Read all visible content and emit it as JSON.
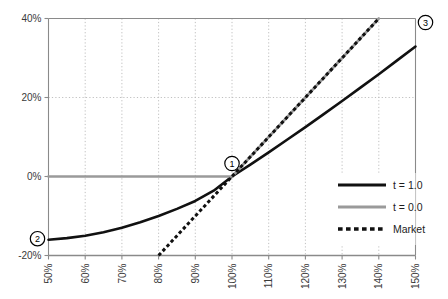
{
  "chart_data": {
    "type": "line",
    "title": "",
    "subtitle": "",
    "xlabel": "",
    "ylabel": "",
    "xlim": [
      50,
      150
    ],
    "ylim": [
      -20,
      40
    ],
    "grid": true,
    "grid_style": "dotted",
    "legend_position": "bottom-right",
    "x_tick_labels": [
      "50%",
      "60%",
      "70%",
      "80%",
      "90%",
      "100%",
      "110%",
      "120%",
      "130%",
      "140%",
      "150%"
    ],
    "x_tick_values": [
      50,
      60,
      70,
      80,
      90,
      100,
      110,
      120,
      130,
      140,
      150
    ],
    "x_tick_rotation": -90,
    "y_tick_labels": [
      "-20%",
      "0%",
      "20%",
      "40%"
    ],
    "y_tick_values": [
      -20,
      0,
      20,
      40
    ],
    "series": [
      {
        "name": "t = 1.0",
        "style": "solid",
        "color": "#111111",
        "width": 2.6,
        "x": [
          50,
          55,
          60,
          65,
          70,
          75,
          80,
          85,
          90,
          95,
          100,
          105,
          110,
          115,
          120,
          125,
          130,
          135,
          140,
          145,
          150
        ],
        "values": [
          -16.0,
          -15.6,
          -15.0,
          -14.1,
          -13.0,
          -11.6,
          -10.0,
          -8.2,
          -6.2,
          -3.6,
          0.0,
          3.0,
          6.1,
          9.3,
          12.5,
          15.8,
          19.1,
          22.5,
          25.9,
          29.4,
          32.9
        ]
      },
      {
        "name": "t = 0.0",
        "style": "solid",
        "color": "#9a9a9a",
        "width": 2.6,
        "x": [
          50,
          60,
          70,
          80,
          90,
          100,
          110,
          120,
          130,
          140
        ],
        "values": [
          0.0,
          0.0,
          0.0,
          0.0,
          0.0,
          0.0,
          10.0,
          20.0,
          30.0,
          40.0
        ]
      },
      {
        "name": "Market",
        "style": "dotted",
        "color": "#111111",
        "width": 3.0,
        "x": [
          80,
          90,
          100,
          110,
          120,
          130,
          140
        ],
        "values": [
          -20.0,
          -10.0,
          0.0,
          10.0,
          20.0,
          30.0,
          40.0
        ]
      }
    ],
    "annotations": [
      {
        "label": "1",
        "x": 100,
        "y": 0,
        "note": "intersection of all three lines at 100% / 0%"
      },
      {
        "label": "2",
        "x": 50,
        "y": -16,
        "note": "left end of t = 1.0 curve"
      },
      {
        "label": "3",
        "x": 148,
        "y": 38,
        "note": "upper right region"
      }
    ]
  },
  "legend": {
    "items": [
      {
        "label": "t = 1.0",
        "swatch": "solid-black-line"
      },
      {
        "label": "t = 0.0",
        "swatch": "solid-gray-line"
      },
      {
        "label": "Market",
        "swatch": "dotted-black-line"
      }
    ]
  },
  "colors": {
    "series_black": "#111111",
    "series_gray": "#9a9a9a",
    "grid": "#b9b9b9",
    "axis": "#8a8a8a",
    "text": "#3a3a3a",
    "background": "#ffffff"
  }
}
